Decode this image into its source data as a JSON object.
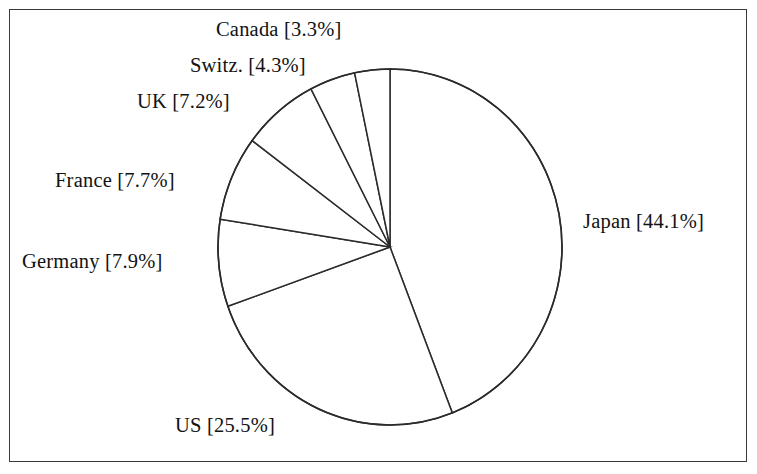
{
  "figure": {
    "background_color": "#ffffff",
    "border_color": "#3a3a3a",
    "stroke_color": "#2b2b2b"
  },
  "chart_data": {
    "type": "pie",
    "title": "",
    "subtitle": "",
    "xlabel": "",
    "ylabel": "",
    "legend_position": "none",
    "grid": false,
    "start_angle_deg": 0,
    "direction": "clockwise",
    "value_unit": "%",
    "labels": [
      "Japan",
      "US",
      "Germany",
      "France",
      "UK",
      "Switz.",
      "Canada"
    ],
    "values": [
      44.1,
      25.5,
      7.9,
      7.7,
      7.2,
      4.3,
      3.3
    ],
    "slices": [
      {
        "label": "Japan",
        "value": 44.1,
        "display": "Japan [44.1%]",
        "start_deg": 0.0,
        "end_deg": 158.76
      },
      {
        "label": "US",
        "value": 25.5,
        "display": "US [25.5%]",
        "start_deg": 158.76,
        "end_deg": 250.56
      },
      {
        "label": "Germany",
        "value": 7.9,
        "display": "Germany [7.9%]",
        "start_deg": 250.56,
        "end_deg": 278.999
      },
      {
        "label": "France",
        "value": 7.7,
        "display": "France [7.7%]",
        "start_deg": 278.999,
        "end_deg": 306.72
      },
      {
        "label": "UK",
        "value": 7.2,
        "display": "UK [7.2%]",
        "start_deg": 306.72,
        "end_deg": 332.64
      },
      {
        "label": "Switz.",
        "value": 4.3,
        "display": "Switz. [4.3%]",
        "start_deg": 332.64,
        "end_deg": 348.12
      },
      {
        "label": "Canada",
        "value": 3.3,
        "display": "Canada [3.3%]",
        "start_deg": 348.12,
        "end_deg": 360.0
      }
    ]
  },
  "labels": {
    "canada": "Canada [3.3%]",
    "switz": "Switz. [4.3%]",
    "uk": "UK [7.2%]",
    "france": "France [7.7%]",
    "germany": "Germany [7.9%]",
    "japan": "Japan [44.1%]",
    "us": "US [25.5%]"
  }
}
